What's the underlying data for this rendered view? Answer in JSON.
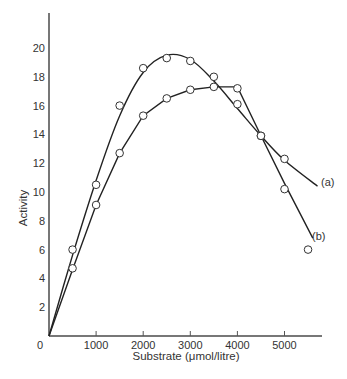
{
  "chart_data": {
    "type": "scatter",
    "title": "",
    "xlabel": "Substrate (μmol/litre)",
    "ylabel": "Activity",
    "xlim": [
      0,
      5800
    ],
    "ylim": [
      0,
      22
    ],
    "x_ticks": [
      0,
      1000,
      2000,
      3000,
      4000,
      5000
    ],
    "x_tick_labels": [
      "0",
      "1000",
      "2000",
      "3000",
      "4000",
      "5000"
    ],
    "y_ticks": [
      2,
      4,
      6,
      8,
      10,
      12,
      14,
      16,
      18,
      20
    ],
    "y_tick_labels": [
      "2",
      "4",
      "6",
      "8",
      "10",
      "12",
      "14",
      "16",
      "18",
      "20"
    ],
    "grid": false,
    "legend": "inline labels at curve ends",
    "series": [
      {
        "name": "(a)",
        "points": [
          {
            "x": 500,
            "y": 6.0
          },
          {
            "x": 1000,
            "y": 10.5
          },
          {
            "x": 1500,
            "y": 16.0
          },
          {
            "x": 2000,
            "y": 18.6
          },
          {
            "x": 2500,
            "y": 19.3
          },
          {
            "x": 3000,
            "y": 19.1
          },
          {
            "x": 3500,
            "y": 18.0
          },
          {
            "x": 4000,
            "y": 16.1
          },
          {
            "x": 4500,
            "y": 13.9
          },
          {
            "x": 5000,
            "y": 12.3
          }
        ],
        "fitted_curve": [
          {
            "x": 0,
            "y": 0
          },
          {
            "x": 500,
            "y": 5.6
          },
          {
            "x": 1000,
            "y": 10.8
          },
          {
            "x": 1500,
            "y": 15.3
          },
          {
            "x": 2000,
            "y": 18.3
          },
          {
            "x": 2500,
            "y": 19.5
          },
          {
            "x": 3000,
            "y": 19.2
          },
          {
            "x": 3500,
            "y": 17.7
          },
          {
            "x": 4000,
            "y": 15.8
          },
          {
            "x": 4500,
            "y": 13.9
          },
          {
            "x": 5000,
            "y": 12.2
          },
          {
            "x": 5700,
            "y": 10.4
          }
        ]
      },
      {
        "name": "(b)",
        "points": [
          {
            "x": 500,
            "y": 4.7
          },
          {
            "x": 1000,
            "y": 9.1
          },
          {
            "x": 1500,
            "y": 12.7
          },
          {
            "x": 2000,
            "y": 15.3
          },
          {
            "x": 2500,
            "y": 16.5
          },
          {
            "x": 3000,
            "y": 17.1
          },
          {
            "x": 3500,
            "y": 17.3
          },
          {
            "x": 4000,
            "y": 17.2
          },
          {
            "x": 4500,
            "y": 13.9
          },
          {
            "x": 5000,
            "y": 10.2
          },
          {
            "x": 5500,
            "y": 6.0
          }
        ],
        "fitted_curve": [
          {
            "x": 0,
            "y": 0
          },
          {
            "x": 500,
            "y": 4.6
          },
          {
            "x": 1000,
            "y": 9.1
          },
          {
            "x": 1500,
            "y": 12.7
          },
          {
            "x": 2000,
            "y": 15.3
          },
          {
            "x": 2500,
            "y": 16.5
          },
          {
            "x": 3000,
            "y": 17.1
          },
          {
            "x": 3500,
            "y": 17.3
          },
          {
            "x": 4000,
            "y": 17.3
          },
          {
            "x": 4500,
            "y": 13.9
          },
          {
            "x": 5000,
            "y": 10.6
          },
          {
            "x": 5600,
            "y": 6.8
          }
        ]
      }
    ]
  },
  "labels": {
    "xlabel": "Substrate (μmol/litre)",
    "ylabel": "Activity",
    "series_a": "(a)",
    "series_b": "(b)",
    "origin": "0"
  }
}
